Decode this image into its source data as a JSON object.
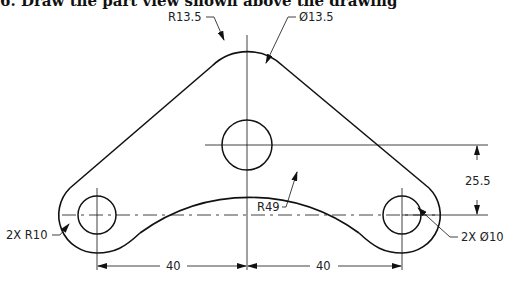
{
  "heading": "6. Draw the part view shown above the drawing",
  "drawing": {
    "title": "Part view — triangular link plate",
    "annotations": {
      "top_radius": "R13.5",
      "top_hole": "Ø13.5",
      "vertical_dim": "25.5",
      "arc_radius": "R49",
      "end_radius": "2X R10",
      "end_holes": "2X Ø10",
      "left_span": "40",
      "right_span": "40"
    },
    "dimensions": {
      "hole_spacing_left": 40,
      "hole_spacing_right": 40,
      "vertical_offset": 25.5,
      "top_outer_radius": 13.5,
      "top_hole_diameter": 13.5,
      "end_outer_radius": 10,
      "end_hole_diameter": 10,
      "bottom_arc_radius": 49
    },
    "colors": {
      "line": "#111111",
      "background": "#ffffff"
    }
  }
}
